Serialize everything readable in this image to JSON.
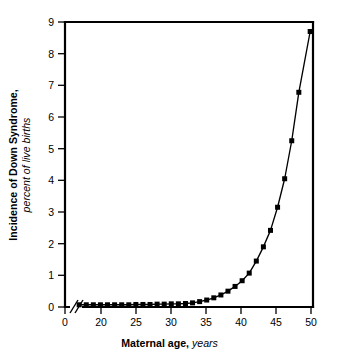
{
  "figure": {
    "background_color": "#ffffff",
    "ink_color": "#000000"
  },
  "chart_data": {
    "type": "line",
    "title": "",
    "subtitle": "",
    "xlabel_bold": "Maternal age,",
    "xlabel_italic": "years",
    "ylabel_bold": "Incidence of Down Syndrome,",
    "ylabel_italic": "percent of live births",
    "xlim": [
      15,
      50
    ],
    "ylim": [
      0,
      9
    ],
    "xticks": [
      0,
      20,
      25,
      30,
      35,
      40,
      45,
      50
    ],
    "xtick_labels": [
      "0",
      "20",
      "25",
      "30",
      "35",
      "40",
      "45",
      "50"
    ],
    "yticks": [
      0,
      1,
      2,
      3,
      4,
      5,
      6,
      7,
      8,
      9
    ],
    "ytick_labels": [
      "0",
      "1",
      "2",
      "3",
      "4",
      "5",
      "6",
      "7",
      "8",
      "9"
    ],
    "axis_break": true,
    "axis_break_note": "double slash break on x-axis between 0 and 20",
    "grid": false,
    "legend": "none",
    "marker": "filled-square",
    "series": [
      {
        "name": "Incidence of Down Syndrome",
        "x": [
          17,
          18,
          19,
          20,
          21,
          22,
          23,
          24,
          25,
          26,
          27,
          28,
          29,
          30,
          31,
          32,
          33,
          34,
          35,
          36,
          37,
          38,
          39,
          40,
          41,
          42,
          43,
          44,
          45,
          46,
          47,
          48,
          49.6
        ],
        "y": [
          0.07,
          0.07,
          0.07,
          0.07,
          0.07,
          0.07,
          0.07,
          0.07,
          0.08,
          0.08,
          0.08,
          0.09,
          0.09,
          0.1,
          0.1,
          0.11,
          0.13,
          0.17,
          0.22,
          0.29,
          0.38,
          0.5,
          0.65,
          0.83,
          1.07,
          1.45,
          1.9,
          2.42,
          3.15,
          4.05,
          5.25,
          6.78,
          8.7
        ]
      }
    ]
  }
}
